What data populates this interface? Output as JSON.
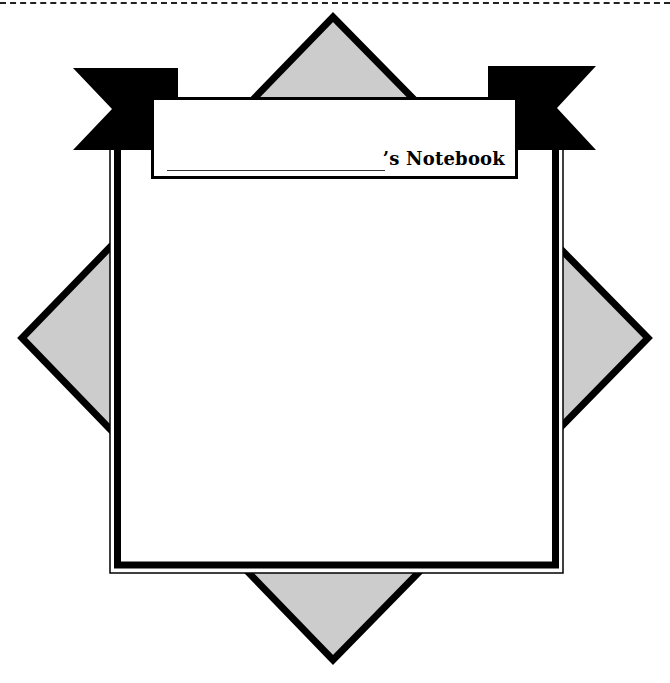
{
  "page": {
    "top_border": "dashed-cut-line",
    "title": {
      "suffix_text": "’s Notebook",
      "name_blank": ""
    },
    "colors": {
      "diamond_fill": "#cccccc",
      "stroke": "#000000",
      "paper": "#ffffff"
    }
  }
}
